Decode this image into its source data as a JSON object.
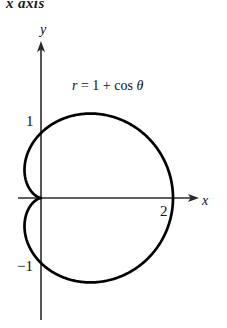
{
  "figure": {
    "top_caption": "x axis",
    "equation": {
      "lhs": "r",
      "equals": "=",
      "rhs_const": "1",
      "plus": "+",
      "func": "cos",
      "var": "θ",
      "full": "r = 1 + cos θ"
    },
    "axes": {
      "x_label": "x",
      "y_label": "y",
      "x_ticks": [
        {
          "label": "2",
          "value": 2
        }
      ],
      "y_ticks": [
        {
          "label": "1",
          "value": 1
        },
        {
          "label": "−1",
          "value": -1
        }
      ]
    },
    "colors": {
      "curve": "#000000",
      "axis": "#2b2b2b",
      "background": "#ffffff",
      "text": "#111111"
    }
  },
  "chart_data": {
    "type": "line",
    "title": "",
    "subtitle": "",
    "xlabel": "x",
    "ylabel": "y",
    "annotations": [
      "r = 1 + cos θ",
      "x axis"
    ],
    "grid": false,
    "legend": "none",
    "curve_name": "cardioid",
    "polar_equation": "r = 1 + cos(theta)",
    "xlim": [
      -0.6,
      2.6
    ],
    "ylim": [
      -1.6,
      1.6
    ],
    "x_ticks": [
      2
    ],
    "y_ticks": [
      1,
      -1
    ],
    "key_points": [
      {
        "name": "cusp",
        "x": 0,
        "y": 0
      },
      {
        "name": "rightmost",
        "x": 2,
        "y": 0
      },
      {
        "name": "top",
        "x": 0.5,
        "y": 1.3
      },
      {
        "name": "bottom",
        "x": 0.5,
        "y": -1.3
      },
      {
        "name": "leftmost",
        "x": -0.25,
        "y": 0.43
      },
      {
        "name": "y-intercept-upper",
        "x": 0,
        "y": 1
      },
      {
        "name": "y-intercept-lower",
        "x": 0,
        "y": -1
      }
    ],
    "series": [
      {
        "name": "r = 1 + cos θ",
        "theta_deg": [
          0,
          15,
          30,
          45,
          60,
          75,
          90,
          105,
          120,
          135,
          150,
          165,
          180,
          195,
          210,
          225,
          240,
          255,
          270,
          285,
          300,
          315,
          330,
          345,
          360
        ],
        "r": [
          2.0,
          1.966,
          1.866,
          1.707,
          1.5,
          1.259,
          1.0,
          0.741,
          0.5,
          0.293,
          0.134,
          0.034,
          0.0,
          0.034,
          0.134,
          0.293,
          0.5,
          0.741,
          1.0,
          1.259,
          1.5,
          1.707,
          1.866,
          1.966,
          2.0
        ],
        "x": [
          2.0,
          1.899,
          1.616,
          1.207,
          0.75,
          0.326,
          0.0,
          -0.192,
          -0.25,
          -0.207,
          -0.116,
          -0.033,
          0.0,
          -0.033,
          -0.116,
          -0.207,
          -0.25,
          -0.192,
          0.0,
          0.326,
          0.75,
          1.207,
          1.616,
          1.899,
          2.0
        ],
        "y": [
          0.0,
          0.509,
          0.933,
          1.207,
          1.299,
          1.216,
          1.0,
          0.716,
          0.433,
          0.207,
          0.067,
          0.009,
          0.0,
          -0.009,
          -0.067,
          -0.207,
          -0.433,
          -0.716,
          -1.0,
          -1.216,
          -1.299,
          -1.207,
          -0.933,
          -0.509,
          0.0
        ]
      }
    ]
  }
}
